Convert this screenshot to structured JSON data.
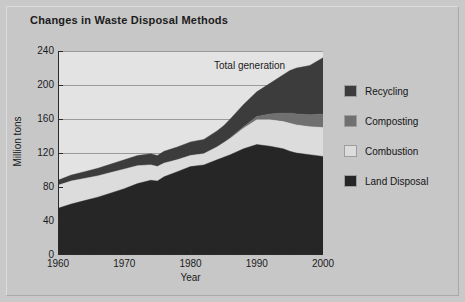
{
  "chart_title": "Changes in Waste Disposal Methods",
  "annotation": "Total generation",
  "axes": {
    "y_label": "Million tons",
    "y_ticks": [
      "240",
      "200",
      "160",
      "120",
      "80",
      "40",
      "0"
    ],
    "x_label": "Year",
    "x_ticks": [
      "1960",
      "1970",
      "1980",
      "1990",
      "2000"
    ]
  },
  "legend": {
    "items": [
      {
        "label": "Recycling",
        "color": "#3c3c3c"
      },
      {
        "label": "Composting",
        "color": "#707070"
      },
      {
        "label": "Combustion",
        "color": "#dcdcdc"
      },
      {
        "label": "Land Disposal",
        "color": "#262626"
      }
    ]
  },
  "colors": {
    "page_background": "#c9c9c9",
    "plot_background": "#e3e3e3",
    "gridline": "#9a9a9a",
    "axis": "#2a2a2a",
    "text": "#1b1b1b",
    "recycling": "#3c3c3c",
    "composting": "#707070",
    "combustion": "#dcdcdc",
    "land_disposal": "#262626"
  },
  "chart_data": {
    "type": "area",
    "stacked": true,
    "title": "Changes in Waste Disposal Methods",
    "xlabel": "Year",
    "ylabel": "Million tons",
    "xlim": [
      1960,
      2000
    ],
    "ylim": [
      0,
      240
    ],
    "y_ticks": [
      0,
      40,
      80,
      120,
      160,
      200,
      240
    ],
    "x_ticks": [
      1960,
      1970,
      1980,
      1990,
      2000
    ],
    "grid": true,
    "legend_position": "right",
    "annotations": [
      {
        "text": "Total generation",
        "x": 1988,
        "y": 228
      }
    ],
    "x": [
      1960,
      1962,
      1964,
      1966,
      1968,
      1970,
      1972,
      1974,
      1975,
      1976,
      1978,
      1980,
      1982,
      1984,
      1985,
      1986,
      1988,
      1990,
      1992,
      1994,
      1995,
      1996,
      1998,
      2000
    ],
    "series": [
      {
        "name": "Land Disposal",
        "color": "#262626",
        "values": [
          55,
          60,
          64,
          68,
          73,
          78,
          84,
          88,
          87,
          92,
          98,
          104,
          106,
          112,
          115,
          118,
          125,
          130,
          128,
          125,
          122,
          120,
          118,
          116
        ]
      },
      {
        "name": "Combustion",
        "color": "#dcdcdc",
        "values": [
          27,
          27,
          26,
          25,
          24,
          23,
          21,
          18,
          17,
          16,
          14,
          13,
          13,
          15,
          17,
          19,
          24,
          29,
          31,
          32,
          33,
          33,
          33,
          34
        ]
      },
      {
        "name": "Composting",
        "color": "#707070",
        "values": [
          0,
          0,
          0,
          0,
          0,
          0,
          0,
          0,
          0,
          0,
          0,
          0,
          0,
          0,
          0,
          1,
          2,
          4,
          7,
          10,
          12,
          13,
          14,
          16
        ]
      },
      {
        "name": "Recycling",
        "color": "#3c3c3c",
        "values": [
          6,
          7,
          8,
          9,
          10,
          11,
          12,
          13,
          13,
          14,
          15,
          16,
          17,
          19,
          20,
          22,
          26,
          29,
          36,
          45,
          50,
          54,
          58,
          66
        ]
      }
    ],
    "totals": [
      88,
      94,
      98,
      102,
      107,
      112,
      117,
      119,
      117,
      122,
      127,
      133,
      136,
      146,
      152,
      160,
      177,
      192,
      202,
      212,
      217,
      220,
      223,
      232
    ]
  }
}
